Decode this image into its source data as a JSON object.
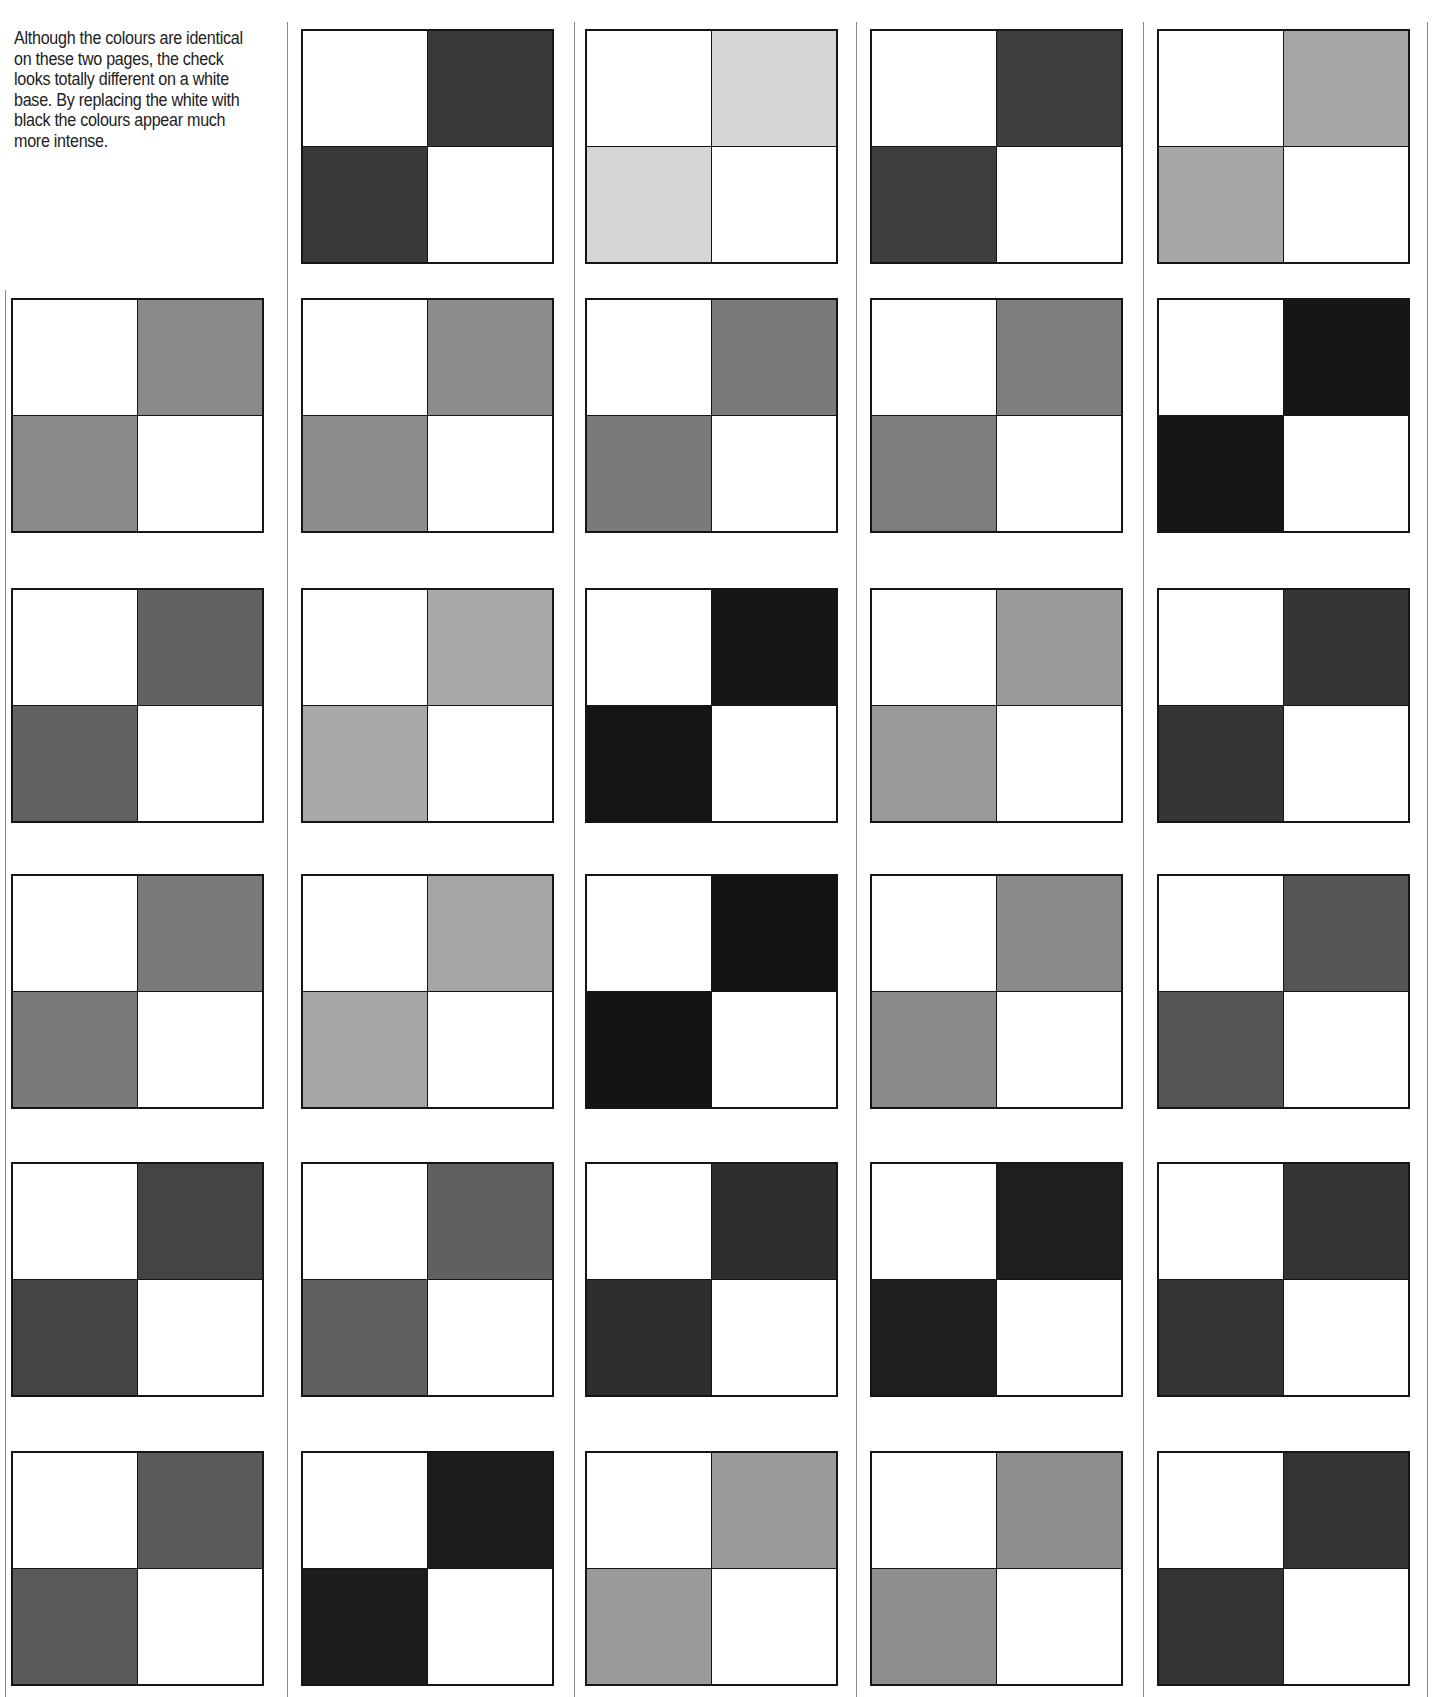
{
  "caption": "Although the colours are identical on these two pages, the check looks totally different on a white base. By replacing the white with black  the colours appear much more intense.",
  "base_color": "#ffffff",
  "line_color": "#151515",
  "columns_x": [
    11,
    301,
    585,
    870,
    1157
  ],
  "dividers_x": [
    5,
    287,
    574,
    856,
    1143,
    1427
  ],
  "rows_y": [
    29,
    298,
    588,
    874,
    1162,
    1451
  ],
  "checks": [
    {
      "row": 0,
      "col": 1,
      "tone": "#3a3a3a"
    },
    {
      "row": 0,
      "col": 2,
      "tone": "#d6d6d6"
    },
    {
      "row": 0,
      "col": 3,
      "tone": "#3e3e3e"
    },
    {
      "row": 0,
      "col": 4,
      "tone": "#a6a6a6"
    },
    {
      "row": 1,
      "col": 0,
      "tone": "#8a8a8a"
    },
    {
      "row": 1,
      "col": 1,
      "tone": "#8c8c8c"
    },
    {
      "row": 1,
      "col": 2,
      "tone": "#7a7a7a"
    },
    {
      "row": 1,
      "col": 3,
      "tone": "#7e7e7e"
    },
    {
      "row": 1,
      "col": 4,
      "tone": "#161616"
    },
    {
      "row": 2,
      "col": 0,
      "tone": "#626262"
    },
    {
      "row": 2,
      "col": 1,
      "tone": "#a9a9a9"
    },
    {
      "row": 2,
      "col": 2,
      "tone": "#151515"
    },
    {
      "row": 2,
      "col": 3,
      "tone": "#9a9a9a"
    },
    {
      "row": 2,
      "col": 4,
      "tone": "#353535"
    },
    {
      "row": 3,
      "col": 0,
      "tone": "#7a7a7a"
    },
    {
      "row": 3,
      "col": 1,
      "tone": "#a6a6a6"
    },
    {
      "row": 3,
      "col": 2,
      "tone": "#141414"
    },
    {
      "row": 3,
      "col": 3,
      "tone": "#8a8a8a"
    },
    {
      "row": 3,
      "col": 4,
      "tone": "#555555"
    },
    {
      "row": 4,
      "col": 0,
      "tone": "#444444"
    },
    {
      "row": 4,
      "col": 1,
      "tone": "#606060"
    },
    {
      "row": 4,
      "col": 2,
      "tone": "#2e2e2e"
    },
    {
      "row": 4,
      "col": 3,
      "tone": "#1e1e1e"
    },
    {
      "row": 4,
      "col": 4,
      "tone": "#343434"
    },
    {
      "row": 5,
      "col": 0,
      "tone": "#5a5a5a"
    },
    {
      "row": 5,
      "col": 1,
      "tone": "#1c1c1c"
    },
    {
      "row": 5,
      "col": 2,
      "tone": "#9a9a9a"
    },
    {
      "row": 5,
      "col": 3,
      "tone": "#8e8e8e"
    },
    {
      "row": 5,
      "col": 4,
      "tone": "#333333"
    }
  ]
}
